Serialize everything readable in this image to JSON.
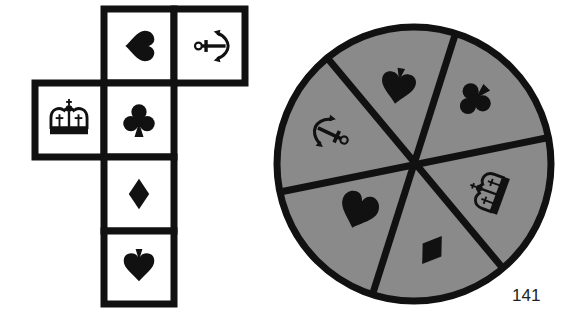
{
  "puzzle": {
    "net": {
      "description": "Cube net of six faces with symbols",
      "border_color": "#111111",
      "face_color": "#ffffff",
      "cells": [
        {
          "id": "top-middle",
          "col": 1,
          "row": 0,
          "symbol": "heart",
          "rotation": 90
        },
        {
          "id": "top-right",
          "col": 2,
          "row": 0,
          "symbol": "anchor",
          "rotation": -90
        },
        {
          "id": "left",
          "col": 0,
          "row": 1,
          "symbol": "crown",
          "rotation": 0
        },
        {
          "id": "center",
          "col": 1,
          "row": 1,
          "symbol": "club",
          "rotation": 0
        },
        {
          "id": "lower",
          "col": 1,
          "row": 2,
          "symbol": "diamond",
          "rotation": 0
        },
        {
          "id": "bottom",
          "col": 1,
          "row": 3,
          "symbol": "spade",
          "rotation": 180
        }
      ]
    },
    "wheel": {
      "description": "Circle divided into six sectors with symbols",
      "fill_color": "#8a8a8a",
      "border_color": "#111111",
      "sectors": [
        {
          "id": "sector-top",
          "symbol": "spade",
          "rotation": 190
        },
        {
          "id": "sector-upper-right",
          "symbol": "club",
          "rotation": 225
        },
        {
          "id": "sector-lower-right",
          "symbol": "crown",
          "rotation": -70
        },
        {
          "id": "sector-bottom",
          "symbol": "diamond",
          "rotation": 35
        },
        {
          "id": "sector-lower-left",
          "symbol": "heart",
          "rotation": 20
        },
        {
          "id": "sector-upper-left",
          "symbol": "anchor",
          "rotation": 115
        }
      ]
    }
  },
  "page_number": "141"
}
